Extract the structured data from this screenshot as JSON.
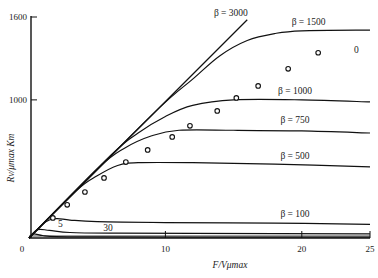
{
  "chart_data": {
    "type": "line",
    "title": "",
    "xlabel": "F/Vμmax",
    "ylabel": "Rv/μmax Km",
    "xlim": [
      0,
      25
    ],
    "ylim": [
      0,
      1600
    ],
    "x_ticks": [
      {
        "value": 0,
        "label": "0"
      },
      {
        "value": 10,
        "label": "10"
      },
      {
        "value": 20,
        "label": "20"
      },
      {
        "value": 25,
        "label": "25"
      }
    ],
    "y_ticks": [
      {
        "value": 1000,
        "label": "1000"
      },
      {
        "value": 1600,
        "label": "1600"
      }
    ],
    "grid": false,
    "series": [
      {
        "name": "β = 3000",
        "label_value": 3000,
        "x": [
          0,
          16
        ],
        "y": [
          0,
          1580
        ]
      },
      {
        "name": "β = 1500",
        "label_value": 1500,
        "x": [
          0,
          9,
          12,
          14,
          16,
          18,
          20,
          25
        ],
        "y": [
          0,
          890,
          1150,
          1320,
          1430,
          1480,
          1500,
          1505
        ]
      },
      {
        "name": "β = 1000",
        "label_value": 1000,
        "x": [
          0,
          6,
          8,
          10,
          12,
          15,
          20,
          25
        ],
        "y": [
          0,
          600,
          760,
          880,
          960,
          1000,
          1000,
          985
        ]
      },
      {
        "name": "β = 750",
        "label_value": 750,
        "x": [
          0,
          5,
          7,
          9,
          11,
          15,
          20,
          25
        ],
        "y": [
          0,
          500,
          650,
          740,
          780,
          780,
          775,
          760
        ]
      },
      {
        "name": "β = 500",
        "label_value": 500,
        "x": [
          0,
          3.5,
          5,
          6.5,
          8,
          12,
          18,
          25
        ],
        "y": [
          0,
          345,
          450,
          525,
          545,
          545,
          535,
          515
        ]
      },
      {
        "name": "β = 100",
        "label_value": 100,
        "x": [
          0,
          1.2,
          2,
          3,
          5,
          10,
          18,
          25
        ],
        "y": [
          0,
          115,
          140,
          130,
          118,
          112,
          108,
          98
        ]
      },
      {
        "name": "30",
        "label_value": 30,
        "x": [
          0,
          0.6,
          1.5,
          3,
          6,
          12,
          25
        ],
        "y": [
          0,
          60,
          55,
          40,
          35,
          33,
          30
        ]
      },
      {
        "name": "5",
        "label_value": 5,
        "x": [
          0,
          0.3,
          1,
          2,
          5,
          12,
          25
        ],
        "y": [
          0,
          30,
          18,
          10,
          8,
          7,
          7
        ]
      }
    ],
    "points_series": {
      "name": "0",
      "x": [
        1.75,
        2.8,
        4.1,
        5.5,
        7.1,
        8.7,
        10.5,
        11.8,
        13.8,
        15.2,
        16.8,
        19.0,
        21.2
      ],
      "y": [
        145,
        240,
        333,
        435,
        550,
        638,
        732,
        812,
        920,
        1014,
        1101,
        1225,
        1341
      ]
    },
    "curve_labels": [
      {
        "text": "β = 3000",
        "series": "β = 3000"
      },
      {
        "text": "β = 1500",
        "series": "β = 1500"
      },
      {
        "text": "β = 1000",
        "series": "β = 1000"
      },
      {
        "text": "β = 750",
        "series": "β = 750"
      },
      {
        "text": "β = 500",
        "series": "β = 500"
      },
      {
        "text": "β = 100",
        "series": "β = 100"
      },
      {
        "text": "30",
        "series": "30"
      },
      {
        "text": "5",
        "series": "5"
      },
      {
        "text": "0",
        "series": "0"
      }
    ]
  }
}
